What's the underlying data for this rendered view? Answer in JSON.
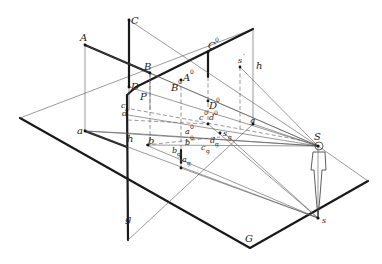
{
  "figure": {
    "labels": {
      "A": "A",
      "B": "B",
      "C": "C",
      "D": "D",
      "P": "P",
      "c": "c",
      "d": "d",
      "a": "a",
      "h_left": "h",
      "b": "b",
      "g_bottom": "g",
      "A0": "A",
      "B0": "B",
      "C0": "C",
      "D0": "D",
      "s_prime": "s",
      "h_right": "h",
      "c0": "c",
      "d0": "d",
      "a0": "a",
      "b0": "b",
      "s_g": "s",
      "d_g": "d",
      "c_g": "c",
      "b_g": "b",
      "a_g": "a",
      "g_right": "g",
      "S": "S",
      "s": "s",
      "G": "G"
    },
    "superscripts": {
      "zero": "0",
      "prime": "'",
      "sub_g": "g"
    },
    "colors": {
      "line": "#1a1a1a",
      "construction": "#555555",
      "background": "#ffffff"
    }
  }
}
